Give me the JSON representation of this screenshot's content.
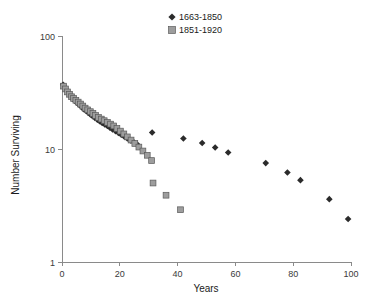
{
  "chart_data": {
    "type": "scatter",
    "title": "",
    "xlabel": "Years",
    "ylabel": "Number Surviving",
    "yscale": "log",
    "xlim": [
      0,
      100
    ],
    "ylim": [
      1,
      100
    ],
    "grid": false,
    "legend_position": "top-right",
    "xticks": [
      0,
      20,
      40,
      60,
      80,
      100
    ],
    "xtick_labels": [
      "0",
      "20",
      "40",
      "60",
      "80",
      "100"
    ],
    "yticks": [
      1,
      10,
      100
    ],
    "ytick_labels": [
      "1",
      "10",
      "100"
    ],
    "series": [
      {
        "name": "1663-1850",
        "marker": "diamond",
        "color": "#2b2b2b",
        "points": [
          [
            0.4,
            37.0
          ],
          [
            1.0,
            35.0
          ],
          [
            1.6,
            33.0
          ],
          [
            2.2,
            31.5
          ],
          [
            2.8,
            30.0
          ],
          [
            3.4,
            28.5
          ],
          [
            4.0,
            27.5
          ],
          [
            4.6,
            26.5
          ],
          [
            5.3,
            25.5
          ],
          [
            6.0,
            24.5
          ],
          [
            6.8,
            23.5
          ],
          [
            7.5,
            22.5
          ],
          [
            8.3,
            21.8
          ],
          [
            9.0,
            21.0
          ],
          [
            9.8,
            20.2
          ],
          [
            10.6,
            19.5
          ],
          [
            11.4,
            18.8
          ],
          [
            12.2,
            18.2
          ],
          [
            13.0,
            17.6
          ],
          [
            13.9,
            17.0
          ],
          [
            14.8,
            16.5
          ],
          [
            15.7,
            16.0
          ],
          [
            16.6,
            15.4
          ],
          [
            17.5,
            14.9
          ],
          [
            18.5,
            14.4
          ],
          [
            19.5,
            13.9
          ],
          [
            20.5,
            13.4
          ],
          [
            21.5,
            12.9
          ],
          [
            22.6,
            12.4
          ],
          [
            23.7,
            11.9
          ],
          [
            24.8,
            11.5
          ],
          [
            26.0,
            11.0
          ],
          [
            31.2,
            14.0
          ],
          [
            42.0,
            12.4
          ],
          [
            48.5,
            11.3
          ],
          [
            53.0,
            10.3
          ],
          [
            57.5,
            9.3
          ],
          [
            70.5,
            7.5
          ],
          [
            78.0,
            6.2
          ],
          [
            82.5,
            5.3
          ],
          [
            92.5,
            3.6
          ],
          [
            99.0,
            2.4
          ]
        ]
      },
      {
        "name": "1851-1920",
        "marker": "square",
        "color": "#9d9d9d",
        "points": [
          [
            0.5,
            36.0
          ],
          [
            1.2,
            34.0
          ],
          [
            1.9,
            32.0
          ],
          [
            2.6,
            30.5
          ],
          [
            3.3,
            29.0
          ],
          [
            4.0,
            28.0
          ],
          [
            4.8,
            27.0
          ],
          [
            5.6,
            26.0
          ],
          [
            6.4,
            25.0
          ],
          [
            7.2,
            24.0
          ],
          [
            8.0,
            23.0
          ],
          [
            8.9,
            22.2
          ],
          [
            9.8,
            21.4
          ],
          [
            10.7,
            20.6
          ],
          [
            11.6,
            19.8
          ],
          [
            12.6,
            19.0
          ],
          [
            13.6,
            18.4
          ],
          [
            14.6,
            17.8
          ],
          [
            15.7,
            17.2
          ],
          [
            16.8,
            16.6
          ],
          [
            17.9,
            16.0
          ],
          [
            19.0,
            15.2
          ],
          [
            20.2,
            14.4
          ],
          [
            21.4,
            13.6
          ],
          [
            22.6,
            12.8
          ],
          [
            23.9,
            12.0
          ],
          [
            25.2,
            11.2
          ],
          [
            26.6,
            10.4
          ],
          [
            28.0,
            9.6
          ],
          [
            29.5,
            8.8
          ],
          [
            31.0,
            7.9
          ],
          [
            31.5,
            5.0
          ],
          [
            36.0,
            3.9
          ],
          [
            41.0,
            2.9
          ]
        ]
      }
    ]
  },
  "legend": {
    "entries": [
      {
        "label": "1663-1850",
        "marker": "diamond"
      },
      {
        "label": "1851-1920",
        "marker": "square"
      }
    ]
  },
  "colors": {
    "diamond": "#2b2b2b",
    "square_fill": "#9d9d9d",
    "square_stroke": "#5a5a5a",
    "axis": "#8a8a8a",
    "text": "#1a1a1a",
    "background": "#ffffff"
  }
}
